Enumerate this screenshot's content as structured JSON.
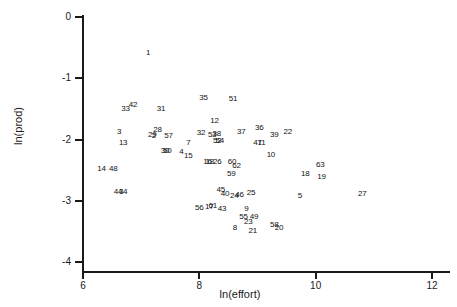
{
  "chart_data": {
    "type": "scatter",
    "title": "",
    "xlabel": "ln(effort)",
    "ylabel": "ln(prod)",
    "xlim": [
      6,
      12
    ],
    "ylim": [
      -4,
      0
    ],
    "grid": false,
    "legend": "none",
    "marker_style": "numeric-label",
    "xticks": [
      6,
      8,
      10,
      12
    ],
    "yticks": [
      0,
      -1,
      -2,
      -3,
      -4
    ],
    "xtick_labels": [
      "6",
      "8",
      "10",
      "12"
    ],
    "ytick_labels": [
      "0",
      "-1",
      "-2",
      "-3",
      "-4"
    ],
    "n_points": 63,
    "points": [
      {
        "label": "1",
        "x": 7.12,
        "y": -0.59
      },
      {
        "label": "35",
        "x": 8.07,
        "y": -1.33
      },
      {
        "label": "51",
        "x": 8.58,
        "y": -1.34
      },
      {
        "label": "33",
        "x": 6.73,
        "y": -1.5
      },
      {
        "label": "42",
        "x": 6.86,
        "y": -1.44
      },
      {
        "label": "31",
        "x": 7.34,
        "y": -1.51
      },
      {
        "label": "12",
        "x": 8.26,
        "y": -1.7
      },
      {
        "label": "3",
        "x": 6.62,
        "y": -1.88
      },
      {
        "label": "28",
        "x": 7.28,
        "y": -1.85
      },
      {
        "label": "29",
        "x": 7.19,
        "y": -1.92
      },
      {
        "label": "2",
        "x": 7.22,
        "y": -1.94
      },
      {
        "label": "57",
        "x": 7.47,
        "y": -1.94
      },
      {
        "label": "32",
        "x": 8.03,
        "y": -1.89
      },
      {
        "label": "53",
        "x": 8.22,
        "y": -1.92
      },
      {
        "label": "38",
        "x": 8.3,
        "y": -1.91
      },
      {
        "label": "37",
        "x": 8.72,
        "y": -1.88
      },
      {
        "label": "36",
        "x": 9.03,
        "y": -1.82
      },
      {
        "label": "39",
        "x": 9.29,
        "y": -1.92
      },
      {
        "label": "22",
        "x": 9.52,
        "y": -1.87
      },
      {
        "label": "13",
        "x": 6.69,
        "y": -2.06
      },
      {
        "label": "7",
        "x": 7.81,
        "y": -2.05
      },
      {
        "label": "52",
        "x": 8.31,
        "y": -2.02
      },
      {
        "label": "54",
        "x": 8.35,
        "y": -2.02
      },
      {
        "label": "47",
        "x": 9.0,
        "y": -2.05
      },
      {
        "label": "11",
        "x": 9.07,
        "y": -2.05
      },
      {
        "label": "30",
        "x": 7.41,
        "y": -2.18
      },
      {
        "label": "50",
        "x": 7.45,
        "y": -2.18
      },
      {
        "label": "4",
        "x": 7.69,
        "y": -2.2
      },
      {
        "label": "15",
        "x": 7.81,
        "y": -2.27
      },
      {
        "label": "10",
        "x": 9.23,
        "y": -2.25
      },
      {
        "label": "14",
        "x": 6.32,
        "y": -2.48
      },
      {
        "label": "48",
        "x": 6.52,
        "y": -2.48
      },
      {
        "label": "16",
        "x": 8.14,
        "y": -2.37
      },
      {
        "label": "18",
        "x": 8.18,
        "y": -2.37
      },
      {
        "label": "26",
        "x": 8.31,
        "y": -2.37
      },
      {
        "label": "60",
        "x": 8.56,
        "y": -2.37
      },
      {
        "label": "62",
        "x": 8.64,
        "y": -2.44
      },
      {
        "label": "63",
        "x": 10.08,
        "y": -2.42
      },
      {
        "label": "59",
        "x": 8.55,
        "y": -2.56
      },
      {
        "label": "18",
        "x": 9.82,
        "y": -2.56
      },
      {
        "label": "19",
        "x": 10.1,
        "y": -2.61
      },
      {
        "label": "44",
        "x": 6.6,
        "y": -2.86
      },
      {
        "label": "34",
        "x": 6.69,
        "y": -2.86
      },
      {
        "label": "45",
        "x": 8.37,
        "y": -2.83
      },
      {
        "label": "40",
        "x": 8.44,
        "y": -2.89
      },
      {
        "label": "24",
        "x": 8.6,
        "y": -2.93
      },
      {
        "label": "46",
        "x": 8.69,
        "y": -2.9
      },
      {
        "label": "25",
        "x": 8.89,
        "y": -2.87
      },
      {
        "label": "5",
        "x": 9.73,
        "y": -2.92
      },
      {
        "label": "27",
        "x": 10.8,
        "y": -2.89
      },
      {
        "label": "56",
        "x": 8.0,
        "y": -3.12
      },
      {
        "label": "17",
        "x": 8.17,
        "y": -3.11
      },
      {
        "label": "61",
        "x": 8.23,
        "y": -3.09
      },
      {
        "label": "43",
        "x": 8.39,
        "y": -3.13
      },
      {
        "label": "9",
        "x": 8.81,
        "y": -3.13
      },
      {
        "label": "55",
        "x": 8.76,
        "y": -3.26
      },
      {
        "label": "49",
        "x": 8.94,
        "y": -3.27
      },
      {
        "label": "23",
        "x": 8.84,
        "y": -3.34
      },
      {
        "label": "8",
        "x": 8.61,
        "y": -3.44
      },
      {
        "label": "58",
        "x": 9.29,
        "y": -3.39
      },
      {
        "label": "20",
        "x": 9.37,
        "y": -3.44
      },
      {
        "label": "21",
        "x": 8.92,
        "y": -3.5
      }
    ]
  }
}
